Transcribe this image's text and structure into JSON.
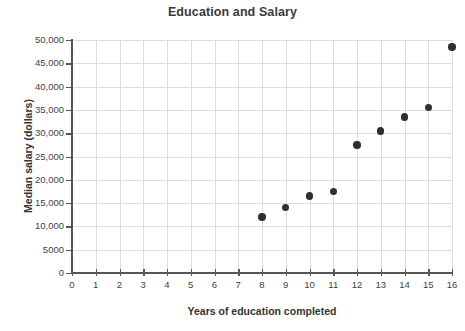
{
  "chart_data": {
    "type": "scatter",
    "title": "Education and Salary",
    "xlabel": "Years of education completed",
    "ylabel": "Median salary (dollars)",
    "xlim": [
      0,
      16
    ],
    "ylim": [
      0,
      50000
    ],
    "grid": true,
    "legend": "none",
    "marker_color": "#2f2f2f",
    "grid_color": "#dcdcdc",
    "axis_color": "#555555",
    "x_ticks": [
      0,
      1,
      2,
      3,
      4,
      5,
      6,
      7,
      8,
      9,
      10,
      11,
      12,
      13,
      14,
      15,
      16
    ],
    "x_tick_labels": [
      "0",
      "1",
      "2",
      "3",
      "4",
      "5",
      "6",
      "7",
      "8",
      "9",
      "10",
      "11",
      "12",
      "13",
      "14",
      "15",
      "16"
    ],
    "y_ticks": [
      0,
      5000,
      10000,
      15000,
      20000,
      25000,
      30000,
      35000,
      40000,
      45000,
      50000
    ],
    "y_tick_labels": [
      "0",
      "5000",
      "10,000",
      "15,000",
      "20,000",
      "25,000",
      "30,000",
      "35,000",
      "40,000",
      "45,000",
      "50,000"
    ],
    "points": [
      {
        "x": 8,
        "y": 12000
      },
      {
        "x": 9,
        "y": 14000
      },
      {
        "x": 10,
        "y": 16500
      },
      {
        "x": 11,
        "y": 17500
      },
      {
        "x": 12,
        "y": 27500
      },
      {
        "x": 13,
        "y": 30500
      },
      {
        "x": 14,
        "y": 33500
      },
      {
        "x": 15,
        "y": 35500
      },
      {
        "x": 16,
        "y": 48500
      }
    ]
  }
}
